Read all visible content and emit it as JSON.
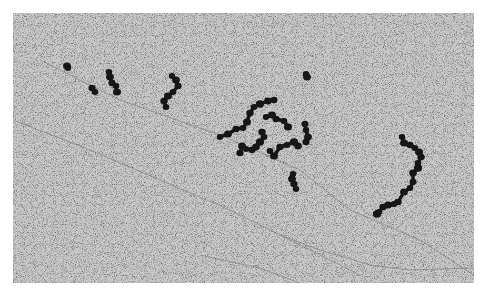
{
  "image": {
    "description": "Grayscale electron micrograph showing chains of dark, roughly spherical particles on a speckled gray background with faint diagonal fibers",
    "background_color": "#c8c8c8",
    "border_color": "#ffffff",
    "particle_color": "#141414",
    "field": {
      "x": 13,
      "y": 13,
      "width": 461,
      "height": 270
    }
  },
  "clusters": [
    {
      "name": "small-pair-left",
      "points": [
        [
          68,
          68
        ],
        [
          67,
          66
        ],
        [
          92,
          88
        ],
        [
          95,
          92
        ]
      ]
    },
    {
      "name": "chain-left",
      "points": [
        [
          109,
          72
        ],
        [
          110,
          77
        ],
        [
          112,
          83
        ],
        [
          116,
          86
        ],
        [
          117,
          92
        ]
      ]
    },
    {
      "name": "chain-center-left",
      "points": [
        [
          172,
          76
        ],
        [
          176,
          80
        ],
        [
          178,
          86
        ],
        [
          173,
          92
        ],
        [
          168,
          96
        ],
        [
          164,
          101
        ],
        [
          166,
          107
        ]
      ]
    },
    {
      "name": "single-blob",
      "points": [
        [
          306,
          74
        ],
        [
          307,
          77
        ]
      ]
    },
    {
      "name": "central-network",
      "points": [
        [
          220,
          137
        ],
        [
          228,
          134
        ],
        [
          236,
          129
        ],
        [
          243,
          128
        ],
        [
          247,
          122
        ],
        [
          250,
          113
        ],
        [
          254,
          107
        ],
        [
          260,
          104
        ],
        [
          268,
          101
        ],
        [
          274,
          100
        ],
        [
          266,
          117
        ],
        [
          272,
          115
        ],
        [
          276,
          119
        ],
        [
          284,
          121
        ],
        [
          288,
          127
        ],
        [
          262,
          132
        ],
        [
          264,
          137
        ],
        [
          260,
          142
        ],
        [
          256,
          147
        ],
        [
          252,
          150
        ],
        [
          246,
          149
        ],
        [
          242,
          146
        ],
        [
          240,
          153
        ],
        [
          270,
          151
        ],
        [
          274,
          156
        ],
        [
          280,
          147
        ],
        [
          287,
          145
        ],
        [
          294,
          142
        ],
        [
          298,
          146
        ],
        [
          305,
          124
        ],
        [
          306,
          130
        ],
        [
          308,
          137
        ],
        [
          306,
          142
        ]
      ]
    },
    {
      "name": "chain-lower-center",
      "points": [
        [
          293,
          174
        ],
        [
          292,
          179
        ],
        [
          294,
          184
        ],
        [
          296,
          189
        ]
      ]
    },
    {
      "name": "arc-right",
      "points": [
        [
          402,
          137
        ],
        [
          404,
          143
        ],
        [
          410,
          145
        ],
        [
          415,
          148
        ],
        [
          419,
          152
        ],
        [
          421,
          157
        ],
        [
          418,
          163
        ],
        [
          418,
          168
        ],
        [
          413,
          173
        ],
        [
          413,
          182
        ],
        [
          410,
          188
        ],
        [
          404,
          192
        ],
        [
          398,
          202
        ],
        [
          394,
          204
        ],
        [
          388,
          205
        ],
        [
          383,
          207
        ],
        [
          379,
          212
        ],
        [
          377,
          214
        ]
      ]
    }
  ]
}
